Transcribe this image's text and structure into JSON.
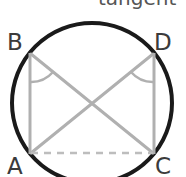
{
  "figure": {
    "caption": "tangent",
    "labels": {
      "A": "A",
      "B": "B",
      "C": "C",
      "D": "D"
    },
    "colors": {
      "circle_stroke": "#1a1a1a",
      "chord_stroke": "#b0b0b0",
      "dashed_stroke": "#bdbdbd",
      "arc_stroke": "#b0b0b0",
      "label_text": "#3b3b3b",
      "caption_text": "#555555",
      "background": "#ffffff"
    },
    "geometry": {
      "circle": {
        "cx": 92,
        "cy": 103,
        "r": 80,
        "stroke_width": 4
      },
      "points": {
        "A": {
          "x": 30,
          "y": 153
        },
        "B": {
          "x": 30,
          "y": 53
        },
        "C": {
          "x": 154,
          "y": 153
        },
        "D": {
          "x": 154,
          "y": 53
        }
      },
      "segments": [
        {
          "name": "AB",
          "from": "A",
          "to": "B",
          "style": "solid"
        },
        {
          "name": "CD",
          "from": "C",
          "to": "D",
          "style": "solid"
        },
        {
          "name": "BC",
          "from": "B",
          "to": "C",
          "style": "solid"
        },
        {
          "name": "AD",
          "from": "A",
          "to": "D",
          "style": "solid"
        },
        {
          "name": "AC",
          "from": "A",
          "to": "C",
          "style": "dashed"
        }
      ],
      "angle_marks": [
        {
          "name": "angle-at-B",
          "vertex": "B"
        },
        {
          "name": "angle-at-D",
          "vertex": "D"
        }
      ],
      "intersection": {
        "x": 92,
        "y": 103
      }
    }
  }
}
